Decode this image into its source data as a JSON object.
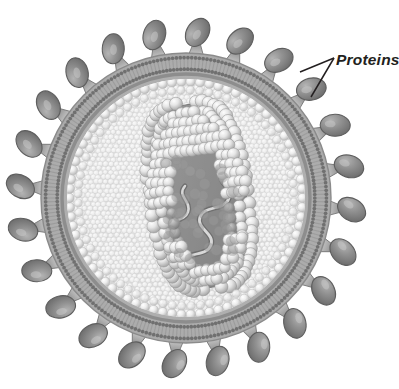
{
  "figure": {
    "background_color": "#ffffff",
    "width": 399,
    "height": 389
  },
  "annotations": [
    {
      "id": "proteins-label",
      "text": "Proteins",
      "color": "#231f20",
      "x": 336,
      "y": 65,
      "style": "bold-italic",
      "leader_lines": [
        {
          "from_x": 334,
          "from_y": 58,
          "to_x": 300,
          "to_y": 72
        },
        {
          "from_x": 334,
          "from_y": 58,
          "to_x": 311,
          "to_y": 97
        }
      ]
    }
  ],
  "structure": {
    "center_x": 186,
    "center_y": 198,
    "envelope_outer_radius": 146,
    "membrane_dark_ring_radius": 143,
    "bilayer_band_radius": 134,
    "capsid_ring_radius": 122,
    "interior_radius": 119,
    "spike_count": 24,
    "spike_stalk_length": 17,
    "protein_ellipse_rx": 15,
    "protein_ellipse_ry": 11
  },
  "core": {
    "shape": "capsule",
    "center_x": 199,
    "center_y": 196,
    "half_width": 49,
    "half_height": 94,
    "rotation_deg": -8,
    "sphere_count": 150,
    "nucleic_acid": "wavy strand"
  },
  "colors": {
    "background": "#ffffff",
    "protein_fill": "#8e8e8e",
    "protein_fill_light": "#a9a9a9",
    "protein_stroke": "#5e5e5e",
    "stalk_fill": "#a6a6a6",
    "stalk_stroke": "#7a7a7a",
    "membrane_dark_ring": "#8a8a8a",
    "membrane_band": "#b6b6b6",
    "lipid_head": "#6b6b6b",
    "interior_fill": "#e4e4e4",
    "bubble_texture": "#efefef",
    "bubble_stroke": "#cfcfcf",
    "capsid_sphere_light": "#f2f2f2",
    "capsid_sphere_mid": "#d8d8d8",
    "core_fill_dark": "#8c8c8c",
    "core_fill_mid": "#a2a2a2",
    "core_shadow": "#7e7e7e",
    "nucleic_acid_fill": "#d3d3d3",
    "nucleic_acid_stroke": "#6f6f6f",
    "label_text": "#231f20",
    "leader_line": "#231f20"
  },
  "legend_parts": [
    "Proteins",
    "Lipid bilayer envelope",
    "Capsid",
    "Nucleic acid"
  ]
}
